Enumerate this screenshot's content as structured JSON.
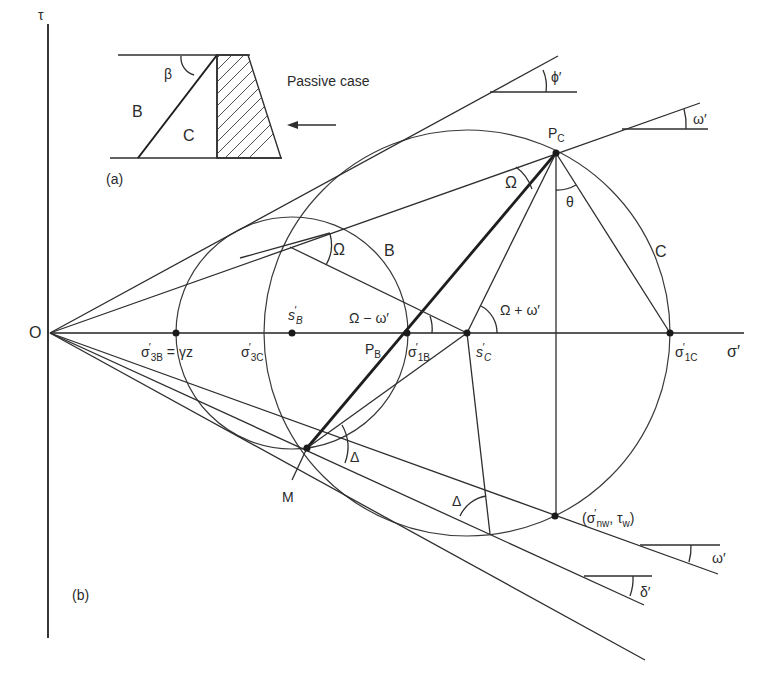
{
  "figure": {
    "axes": {
      "tau_label": "τ",
      "sigma_label": "σ′",
      "origin_label": "O"
    },
    "panel_a": {
      "label": "(a)",
      "region_b": "B",
      "region_c": "C",
      "angle_beta": "β",
      "caption": "Passive case",
      "arrow": "←"
    },
    "panel_b": {
      "label": "(b)"
    },
    "points": {
      "s_b": {
        "main": "s",
        "sup": "′",
        "sub": "B"
      },
      "s_c": {
        "main": "s",
        "sup": "′",
        "sub": "C"
      },
      "sigma_3b": {
        "main": "σ",
        "sup": "′",
        "sub": "3B",
        "suffix": " = γz"
      },
      "sigma_3c": {
        "main": "σ",
        "sup": "′",
        "sub": "3C"
      },
      "sigma_1b": {
        "main": "σ",
        "sup": "′",
        "sub": "1B"
      },
      "sigma_1c": {
        "main": "σ",
        "sup": "′",
        "sub": "1C"
      },
      "p_b": {
        "main": "P",
        "sub": "B"
      },
      "p_c": {
        "main": "P",
        "sub": "C"
      },
      "m": "M",
      "wall_point": {
        "open": "(σ",
        "sup": "′",
        "sub": "nw",
        "mid": ", τ",
        "sub2": "w",
        "close": ")"
      }
    },
    "circles": {
      "circle_b": "B",
      "circle_c": "C"
    },
    "angles": {
      "phi": "ϕ′",
      "omega_top": "ω′",
      "omega_bottom": "ω′",
      "delta_prime": "δ′",
      "Omega_at_b": "Ω",
      "Omega_at_pc": "Ω",
      "theta": "θ",
      "Omega_minus_omega": "Ω − ω′",
      "Omega_plus_omega": "Ω + ω′",
      "Delta_at_m": "Δ",
      "Delta_lower": "Δ"
    }
  }
}
